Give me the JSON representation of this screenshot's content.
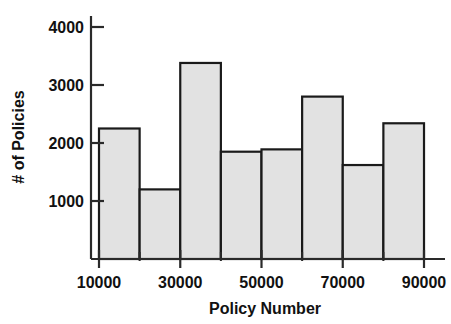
{
  "chart_data": {
    "type": "bar",
    "title": "",
    "subtitle": "",
    "xlabel": "Policy Number",
    "ylabel": "# of Policies",
    "xlim": [
      10000,
      90000
    ],
    "ylim": [
      0,
      4350
    ],
    "grid": false,
    "legend": null,
    "bin_width": 10000,
    "bin_edges": [
      10000,
      20000,
      30000,
      40000,
      50000,
      60000,
      70000,
      80000,
      90000
    ],
    "categories": [
      "10000-20000",
      "20000-30000",
      "30000-40000",
      "40000-50000",
      "50000-60000",
      "60000-70000",
      "70000-80000",
      "80000-90000"
    ],
    "values": [
      2250,
      1200,
      3380,
      1850,
      1890,
      2800,
      1620,
      2340
    ],
    "xticks": [
      10000,
      30000,
      50000,
      70000,
      90000
    ],
    "xtick_labels": [
      "10000",
      "30000",
      "50000",
      "70000",
      "90000"
    ],
    "xticks_minor": [
      20000,
      40000,
      60000,
      80000
    ],
    "yticks": [
      1000,
      2000,
      3000,
      4000
    ],
    "ytick_labels": [
      "1000",
      "2000",
      "3000",
      "4000"
    ],
    "bar_fill_color": "#e2e2e2",
    "bar_edge_color": "#1a1a1a",
    "axis_color": "#2a2a2a",
    "background_color": "#ffffff"
  }
}
